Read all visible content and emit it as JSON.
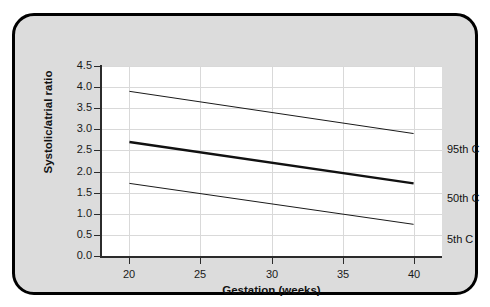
{
  "chart_data": {
    "type": "line",
    "title": "",
    "xlabel": "Gestation (weeks)",
    "ylabel": "Systolic/atrial ratio",
    "xlim": [
      18,
      42
    ],
    "ylim": [
      0.0,
      4.5
    ],
    "grid": true,
    "legend_position": "right-of-plot",
    "x_ticks": [
      "20",
      "25",
      "30",
      "35",
      "40"
    ],
    "x_tick_values": [
      20,
      25,
      30,
      35,
      40
    ],
    "y_ticks": [
      "0.0",
      "0.5",
      "1.0",
      "1.5",
      "2.0",
      "2.5",
      "3.0",
      "3.5",
      "4.0",
      "4.5"
    ],
    "y_tick_values": [
      0.0,
      0.5,
      1.0,
      1.5,
      2.0,
      2.5,
      3.0,
      3.5,
      4.0,
      4.5
    ],
    "x": [
      20,
      40
    ],
    "series": [
      {
        "name": "95th C",
        "values": [
          3.9,
          2.9
        ],
        "style": "thin",
        "color": "#1a1a1a",
        "width": 1
      },
      {
        "name": "50th C",
        "values": [
          2.7,
          1.72
        ],
        "style": "bold",
        "color": "#111111",
        "width": 2.4
      },
      {
        "name": "5th C",
        "values": [
          1.72,
          0.75
        ],
        "style": "thin",
        "color": "#1a1a1a",
        "width": 1
      }
    ]
  },
  "figure": {
    "frame_fill": "#dcdcdc",
    "frame_border": "#000000",
    "plot_background": "#ffffff",
    "gridline_color": "#d9d9d9",
    "axis_color": "#2b2b2b"
  }
}
